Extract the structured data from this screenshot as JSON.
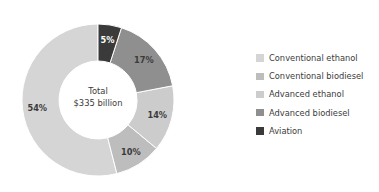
{
  "chart_data": {
    "type": "pie",
    "variant": "donut",
    "title": "",
    "subtitle": "",
    "xlabel": "",
    "ylabel": "",
    "center_label_line1": "Total",
    "center_label_line2": "$335 billion",
    "total": "$335 billion",
    "units": "percent of total",
    "legend_position": "right",
    "grid": false,
    "categories": [
      "Conventional ethanol",
      "Conventional biodiesel",
      "Advanced ethanol",
      "Advanced biodiesel",
      "Aviation"
    ],
    "values": [
      54,
      10,
      14,
      17,
      5
    ],
    "value_labels": [
      "54%",
      "10%",
      "14%",
      "17%",
      "5%"
    ],
    "colors": [
      "#d5d5d5",
      "#bdbdbd",
      "#cccccc",
      "#8f8f8f",
      "#3a3a3a"
    ],
    "label_text_colors": [
      "#3b3b3b",
      "#3b3b3b",
      "#3b3b3b",
      "#3b3b3b",
      "#ffffff"
    ],
    "direction": "counterclockwise",
    "start_angle_deg": 0,
    "slices": [
      {
        "name": "Conventional ethanol",
        "value": 54,
        "label": "54%",
        "color": "#d5d5d5",
        "label_color": "#3b3b3b"
      },
      {
        "name": "Conventional biodiesel",
        "value": 10,
        "label": "10%",
        "color": "#bdbdbd",
        "label_color": "#3b3b3b"
      },
      {
        "name": "Advanced ethanol",
        "value": 14,
        "label": "14%",
        "color": "#cccccc",
        "label_color": "#3b3b3b"
      },
      {
        "name": "Advanced biodiesel",
        "value": 17,
        "label": "17%",
        "color": "#8f8f8f",
        "label_color": "#3b3b3b"
      },
      {
        "name": "Aviation",
        "value": 5,
        "label": "5%",
        "color": "#3a3a3a",
        "label_color": "#ffffff"
      }
    ]
  },
  "legend": {
    "items": [
      {
        "label": "Conventional ethanol",
        "color": "#d5d5d5"
      },
      {
        "label": "Conventional biodiesel",
        "color": "#bdbdbd"
      },
      {
        "label": "Advanced ethanol",
        "color": "#cccccc"
      },
      {
        "label": "Advanced biodiesel",
        "color": "#8f8f8f"
      },
      {
        "label": "Aviation",
        "color": "#3a3a3a"
      }
    ]
  }
}
